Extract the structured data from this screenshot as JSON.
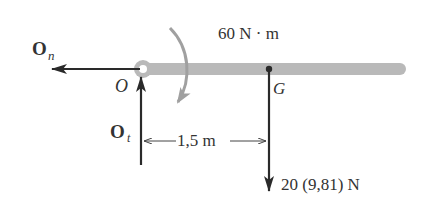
{
  "figure": {
    "moment_label": "60 N · m",
    "dimension_label": "1,5 m",
    "weight_label": "20 (9,81) N",
    "point_O": "O",
    "point_G": "G",
    "force_On": {
      "main": "O",
      "sub": "n"
    },
    "force_Ot": {
      "main": "O",
      "sub": "t"
    }
  },
  "colors": {
    "rod": "#b9b9b9",
    "arrow": "#2a2a2a",
    "moment_arrow": "#a0a0a0",
    "text": "#333333"
  }
}
